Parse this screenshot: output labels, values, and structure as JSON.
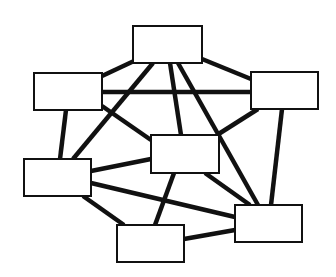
{
  "diagram": {
    "type": "network-graph",
    "background": "#ffffff",
    "node_fill": "#ffffff",
    "stroke_color": "#111111",
    "node_stroke_width": 2,
    "edge_stroke_width": 4.5,
    "nodes": [
      {
        "id": "top",
        "label": "",
        "x": 133,
        "y": 26,
        "w": 69,
        "h": 37
      },
      {
        "id": "left-top",
        "label": "",
        "x": 34,
        "y": 73,
        "w": 68,
        "h": 37
      },
      {
        "id": "right-top",
        "label": "",
        "x": 251,
        "y": 72,
        "w": 67,
        "h": 37
      },
      {
        "id": "center",
        "label": "",
        "x": 151,
        "y": 135,
        "w": 68,
        "h": 38
      },
      {
        "id": "left-bottom",
        "label": "",
        "x": 24,
        "y": 159,
        "w": 67,
        "h": 37
      },
      {
        "id": "right-bottom",
        "label": "",
        "x": 235,
        "y": 205,
        "w": 67,
        "h": 37
      },
      {
        "id": "bottom-center",
        "label": "",
        "x": 117,
        "y": 225,
        "w": 67,
        "h": 37
      }
    ],
    "edges": [
      {
        "from": "top",
        "to": "left-top",
        "x1": 134,
        "y1": 61,
        "x2": 102,
        "y2": 76
      },
      {
        "from": "top",
        "to": "right-top",
        "x1": 202,
        "y1": 59,
        "x2": 251,
        "y2": 79
      },
      {
        "from": "top",
        "to": "left-bottom",
        "x1": 153,
        "y1": 63,
        "x2": 73,
        "y2": 159
      },
      {
        "from": "top",
        "to": "center",
        "x1": 170,
        "y1": 63,
        "x2": 181,
        "y2": 135
      },
      {
        "from": "top",
        "to": "right-bottom",
        "x1": 178,
        "y1": 63,
        "x2": 258,
        "y2": 205
      },
      {
        "from": "left-top",
        "to": "right-top",
        "x1": 102,
        "y1": 92,
        "x2": 251,
        "y2": 92
      },
      {
        "from": "left-top",
        "to": "center",
        "x1": 102,
        "y1": 106,
        "x2": 151,
        "y2": 140
      },
      {
        "from": "left-top",
        "to": "left-bottom",
        "x1": 66,
        "y1": 110,
        "x2": 60,
        "y2": 159
      },
      {
        "from": "right-top",
        "to": "center",
        "x1": 258,
        "y1": 109,
        "x2": 217,
        "y2": 135
      },
      {
        "from": "right-top",
        "to": "right-bottom",
        "x1": 282,
        "y1": 109,
        "x2": 271,
        "y2": 205
      },
      {
        "from": "left-bottom",
        "to": "center",
        "x1": 91,
        "y1": 171,
        "x2": 151,
        "y2": 159
      },
      {
        "from": "left-bottom",
        "to": "right-bottom",
        "x1": 91,
        "y1": 183,
        "x2": 235,
        "y2": 217
      },
      {
        "from": "left-bottom",
        "to": "bottom-center",
        "x1": 83,
        "y1": 196,
        "x2": 124,
        "y2": 225
      },
      {
        "from": "center",
        "to": "bottom-center",
        "x1": 174,
        "y1": 173,
        "x2": 155,
        "y2": 225
      },
      {
        "from": "center",
        "to": "right-bottom",
        "x1": 205,
        "y1": 173,
        "x2": 250,
        "y2": 205
      },
      {
        "from": "bottom-center",
        "to": "right-bottom",
        "x1": 184,
        "y1": 239,
        "x2": 235,
        "y2": 230
      }
    ]
  }
}
